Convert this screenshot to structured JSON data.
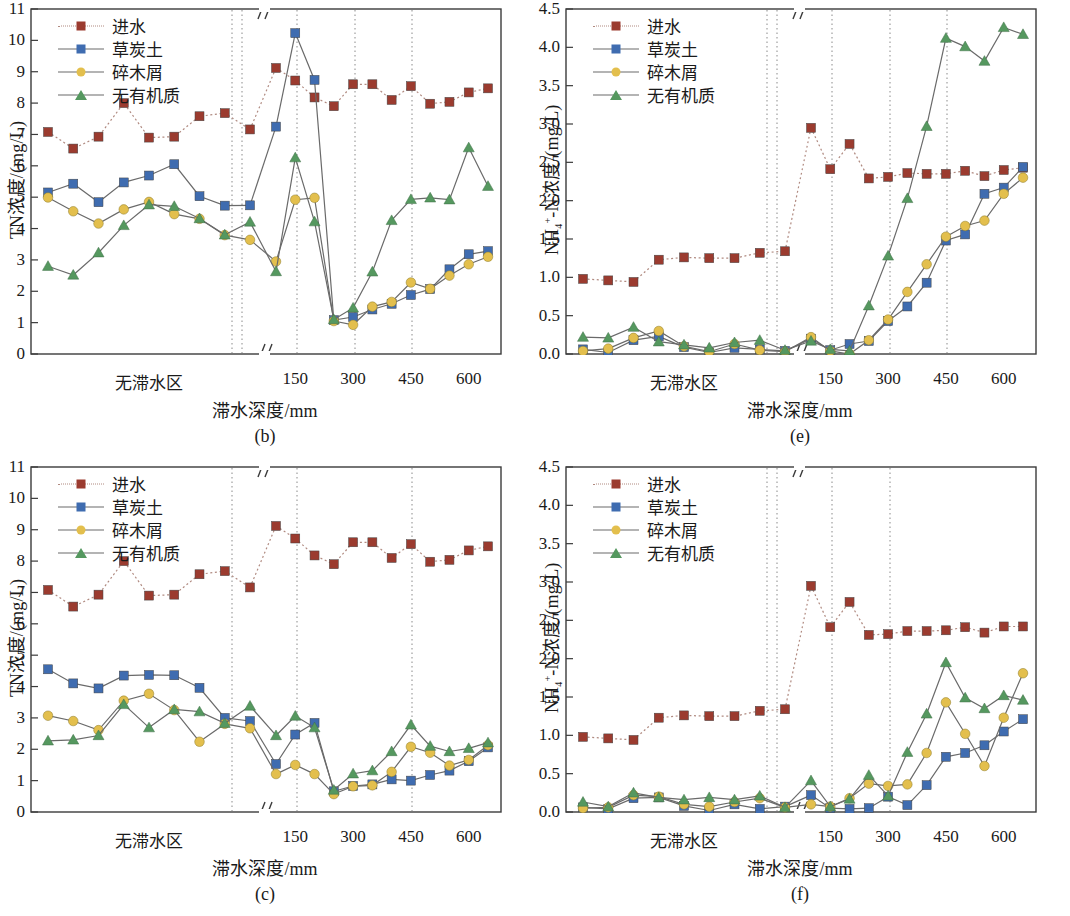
{
  "figure": {
    "series_names": [
      "进水",
      "草炭土",
      "碎木屑",
      "无有机质"
    ],
    "colors": {
      "influent": "#9b3b2f",
      "peat_soil": "#3f6cb0",
      "wood_chips": "#e3bf4d",
      "no_organic": "#55985f",
      "axis": "#3b3b3b",
      "gridline": "#8a8a8a"
    },
    "markers": {
      "influent": "square",
      "peat_soil": "square",
      "wood_chips": "circle",
      "no_organic": "triangle"
    },
    "linestyles": {
      "influent": "dotted",
      "peat_soil": "solid",
      "wood_chips": "solid",
      "no_organic": "solid"
    },
    "xaxis_title": "滞水深度/mm",
    "x_left_label": "无滞水区",
    "x_right_ticks": [
      "150",
      "300",
      "450",
      "600"
    ],
    "axis_break_symbol": "//"
  },
  "chart_data": [
    {
      "id": "b",
      "type": "line",
      "title": "(b)",
      "xlabel": "滞水深度/mm",
      "ylabel": "TN浓度/(mg/L)",
      "ylim": [
        0,
        11
      ],
      "yticks": [
        0,
        1,
        2,
        3,
        4,
        5,
        6,
        7,
        8,
        9,
        10,
        11
      ],
      "grid": false,
      "legend_position": "top-left",
      "x_category_left": "无滞水区",
      "x_ticks_right": [
        150,
        300,
        450,
        600
      ],
      "x_broken_axis": true,
      "vertical_dotted_lines": [
        262,
        272,
        327,
        385,
        442
      ],
      "series": [
        {
          "name": "进水",
          "key": "influent",
          "values_left": [
            7.08,
            6.55,
            6.93,
            8.0,
            6.9,
            6.93,
            7.58,
            7.68,
            7.16
          ],
          "values_right": [
            9.12,
            8.72,
            8.18,
            7.9,
            8.6,
            8.6,
            8.1,
            8.54,
            7.98,
            8.04,
            8.34,
            8.47
          ]
        },
        {
          "name": "草炭土",
          "key": "peat_soil",
          "values_left": [
            5.15,
            5.43,
            4.84,
            5.47,
            5.69,
            6.05,
            5.03,
            4.73,
            4.74
          ],
          "values_right": [
            7.25,
            10.23,
            8.74,
            1.08,
            1.18,
            1.42,
            1.6,
            1.88,
            2.07,
            2.7,
            3.18,
            3.28
          ]
        },
        {
          "name": "碎木屑",
          "key": "wood_chips",
          "values_left": [
            4.99,
            4.55,
            4.16,
            4.61,
            4.85,
            4.46,
            4.31,
            3.79,
            3.64
          ],
          "values_right": [
            2.95,
            4.92,
            4.98,
            1.05,
            0.93,
            1.51,
            1.66,
            2.28,
            2.08,
            2.5,
            2.86,
            3.1
          ]
        },
        {
          "name": "无有机质",
          "key": "no_organic",
          "values_left": [
            2.8,
            2.52,
            3.23,
            4.1,
            4.76,
            4.71,
            4.32,
            3.8,
            4.21
          ],
          "values_right": [
            2.63,
            6.26,
            4.22,
            1.1,
            1.47,
            2.62,
            4.26,
            4.93,
            4.98,
            4.92,
            6.58,
            5.35
          ]
        }
      ]
    },
    {
      "id": "e",
      "type": "line",
      "title": "(e)",
      "xlabel": "滞水深度/mm",
      "ylabel": "NH4+-N浓度/(mg/L)",
      "ylim": [
        0.0,
        4.5
      ],
      "yticks": [
        0.0,
        0.5,
        1.0,
        1.5,
        2.0,
        2.5,
        3.0,
        3.5,
        4.0,
        4.5
      ],
      "grid": false,
      "legend_position": "top-left",
      "x_category_left": "无滞水区",
      "x_ticks_right": [
        150,
        300,
        450,
        600
      ],
      "x_broken_axis": true,
      "vertical_dotted_lines": [
        262,
        272,
        327,
        385,
        442
      ],
      "series": [
        {
          "name": "进水",
          "key": "influent",
          "values_left": [
            0.98,
            0.96,
            0.94,
            1.23,
            1.26,
            1.25,
            1.25,
            1.32,
            1.34
          ],
          "values_right": [
            2.95,
            2.41,
            2.74,
            2.29,
            2.31,
            2.36,
            2.35,
            2.35,
            2.39,
            2.32,
            2.4,
            2.43
          ]
        },
        {
          "name": "草炭土",
          "key": "peat_soil",
          "values_left": [
            0.06,
            0.02,
            0.18,
            0.23,
            0.09,
            0.02,
            0.08,
            0.06,
            0.04
          ],
          "values_right": [
            0.2,
            0.05,
            0.13,
            0.17,
            0.43,
            0.62,
            0.93,
            1.48,
            1.56,
            2.09,
            2.17,
            2.44
          ]
        },
        {
          "name": "碎木屑",
          "key": "wood_chips",
          "values_left": [
            0.04,
            0.07,
            0.21,
            0.3,
            0.1,
            0.03,
            0.13,
            0.05,
            0.03
          ],
          "values_right": [
            0.22,
            0.04,
            0.0,
            0.18,
            0.45,
            0.81,
            1.17,
            1.53,
            1.67,
            1.74,
            2.09,
            2.3
          ]
        },
        {
          "name": "无有机质",
          "key": "no_organic",
          "values_left": [
            0.22,
            0.21,
            0.35,
            0.16,
            0.12,
            0.08,
            0.15,
            0.18,
            0.05
          ],
          "values_right": [
            0.17,
            0.06,
            0.04,
            0.63,
            1.28,
            2.03,
            2.97,
            4.12,
            4.01,
            3.82,
            4.26,
            4.17
          ]
        }
      ]
    },
    {
      "id": "c",
      "type": "line",
      "title": "(c)",
      "xlabel": "滞水深度/mm",
      "ylabel": "TN浓度/(mg/L)",
      "ylim": [
        0,
        11
      ],
      "yticks": [
        0,
        1,
        2,
        3,
        4,
        5,
        6,
        7,
        8,
        9,
        10,
        11
      ],
      "grid": false,
      "legend_position": "top-left",
      "x_category_left": "无滞水区",
      "x_ticks_right": [
        150,
        300,
        450,
        600
      ],
      "x_broken_axis": true,
      "vertical_dotted_lines": [
        262,
        327,
        442
      ],
      "series": [
        {
          "name": "进水",
          "key": "influent",
          "values_left": [
            7.08,
            6.55,
            6.93,
            8.0,
            6.9,
            6.93,
            7.58,
            7.68,
            7.16
          ],
          "values_right": [
            9.12,
            8.72,
            8.18,
            7.9,
            8.6,
            8.6,
            8.1,
            8.54,
            7.98,
            8.04,
            8.34,
            8.47
          ]
        },
        {
          "name": "草炭土",
          "key": "peat_soil",
          "values_left": [
            4.55,
            4.1,
            3.94,
            4.35,
            4.37,
            4.36,
            3.96,
            3.0,
            2.9
          ],
          "values_right": [
            1.53,
            2.47,
            2.84,
            0.66,
            0.83,
            0.88,
            1.04,
            1.0,
            1.18,
            1.32,
            1.62,
            2.06
          ]
        },
        {
          "name": "碎木屑",
          "key": "wood_chips",
          "values_left": [
            3.07,
            2.9,
            2.61,
            3.55,
            3.77,
            3.25,
            2.24,
            2.81,
            2.67
          ],
          "values_right": [
            1.21,
            1.5,
            1.21,
            0.57,
            0.82,
            0.85,
            1.28,
            2.08,
            1.89,
            1.48,
            1.66,
            2.13
          ]
        },
        {
          "name": "无有机质",
          "key": "no_organic",
          "values_left": [
            2.27,
            2.3,
            2.44,
            3.43,
            2.69,
            3.27,
            3.2,
            2.83,
            3.38
          ],
          "values_right": [
            2.44,
            3.06,
            2.69,
            0.7,
            1.22,
            1.32,
            1.93,
            2.78,
            2.1,
            1.93,
            2.03,
            2.21
          ]
        }
      ]
    },
    {
      "id": "f",
      "type": "line",
      "title": "(f)",
      "xlabel": "滞水深度/mm",
      "ylabel": "NH4+-N浓度/(mg/L)",
      "ylim": [
        0.0,
        4.5
      ],
      "yticks": [
        0.0,
        0.5,
        1.0,
        1.5,
        2.0,
        2.5,
        3.0,
        3.5,
        4.0,
        4.5
      ],
      "grid": false,
      "legend_position": "top-left",
      "x_category_left": "无滞水区",
      "x_ticks_right": [
        150,
        300,
        450,
        600
      ],
      "x_broken_axis": true,
      "vertical_dotted_lines": [
        262,
        272,
        327,
        385
      ],
      "series": [
        {
          "name": "进水",
          "key": "influent",
          "values_left": [
            0.98,
            0.96,
            0.94,
            1.23,
            1.26,
            1.25,
            1.25,
            1.32,
            1.34
          ],
          "values_right": [
            2.95,
            2.41,
            2.74,
            2.31,
            2.32,
            2.36,
            2.36,
            2.37,
            2.41,
            2.34,
            2.42,
            2.42
          ]
        },
        {
          "name": "草炭土",
          "key": "peat_soil",
          "values_left": [
            0.06,
            0.04,
            0.18,
            0.19,
            0.08,
            0.02,
            0.1,
            0.04,
            0.07
          ],
          "values_right": [
            0.22,
            0.05,
            0.04,
            0.05,
            0.2,
            0.09,
            0.35,
            0.72,
            0.77,
            0.87,
            1.05,
            1.21
          ]
        },
        {
          "name": "碎木屑",
          "key": "wood_chips",
          "values_left": [
            0.05,
            0.06,
            0.22,
            0.2,
            0.1,
            0.07,
            0.13,
            0.18,
            0.06
          ],
          "values_right": [
            0.1,
            0.07,
            0.18,
            0.37,
            0.34,
            0.36,
            0.77,
            1.43,
            1.02,
            0.6,
            1.23,
            1.81
          ]
        },
        {
          "name": "无有机质",
          "key": "no_organic",
          "values_left": [
            0.13,
            0.07,
            0.25,
            0.19,
            0.16,
            0.19,
            0.16,
            0.21,
            0.06
          ],
          "values_right": [
            0.41,
            0.07,
            0.17,
            0.48,
            0.21,
            0.78,
            1.28,
            1.95,
            1.49,
            1.35,
            1.52,
            1.46
          ]
        }
      ]
    }
  ]
}
